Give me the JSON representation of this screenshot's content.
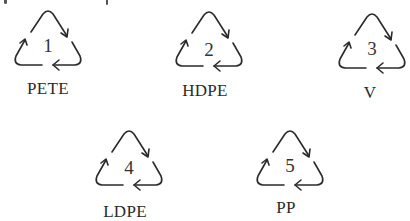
{
  "diagram": {
    "type": "resin-identification-codes",
    "stroke_color": "#2a2a2a",
    "symbols": [
      {
        "code": "1",
        "label": "PETE"
      },
      {
        "code": "2",
        "label": "HDPE"
      },
      {
        "code": "3",
        "label": "V"
      },
      {
        "code": "4",
        "label": "LDPE"
      },
      {
        "code": "5",
        "label": "PP"
      }
    ]
  }
}
